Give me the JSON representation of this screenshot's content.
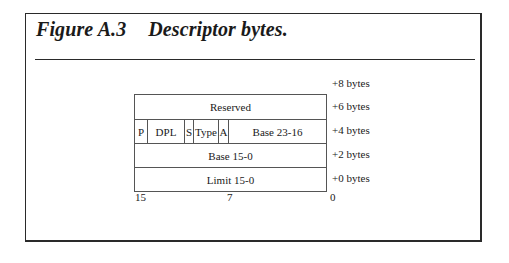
{
  "figure": {
    "number": "Figure A.3",
    "caption": "Descriptor bytes."
  },
  "table": {
    "rows": [
      {
        "offset": "+6 bytes",
        "cells": [
          {
            "label": "Reserved"
          }
        ]
      },
      {
        "offset": "+4 bytes",
        "cells": [
          {
            "label": "P"
          },
          {
            "label": "DPL"
          },
          {
            "label": "S"
          },
          {
            "label": "Type"
          },
          {
            "label": "A"
          },
          {
            "label": "Base 23-16"
          }
        ]
      },
      {
        "offset": "+2 bytes",
        "cells": [
          {
            "label": "Base 15-0"
          }
        ]
      },
      {
        "offset": "+0 bytes",
        "cells": [
          {
            "label": "Limit 15-0"
          }
        ]
      }
    ],
    "top_offset": "+8 bytes",
    "bit_labels": {
      "left": "15",
      "middle": "7",
      "right": "0"
    }
  }
}
